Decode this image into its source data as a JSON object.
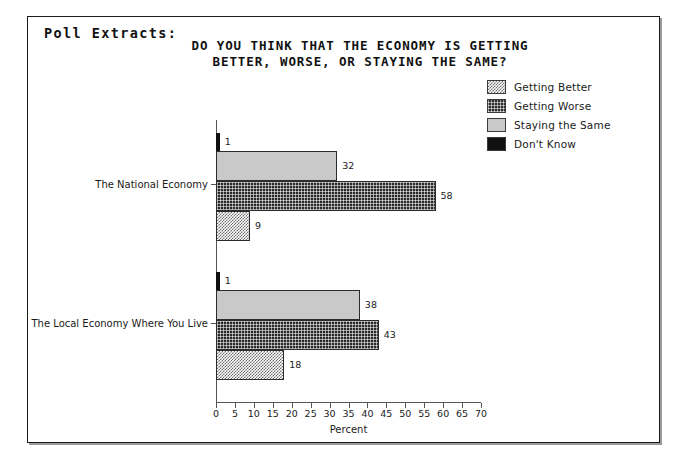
{
  "frame": {
    "poll_extracts_label": "Poll Extracts:"
  },
  "chart_data": {
    "type": "bar",
    "orientation": "horizontal",
    "title_lines": [
      "DO YOU THINK THAT THE ECONOMY IS GETTING",
      "BETTER, WORSE, OR STAYING THE SAME?"
    ],
    "title": "DO YOU THINK THAT THE ECONOMY IS GETTING BETTER, WORSE, OR STAYING THE SAME?",
    "xlabel": "Percent",
    "ylabel": "",
    "xlim": [
      0,
      70
    ],
    "xticks": [
      0,
      5,
      10,
      15,
      20,
      25,
      30,
      35,
      40,
      45,
      50,
      55,
      60,
      65,
      70
    ],
    "grid": false,
    "legend_position": "top-right",
    "categories": [
      "The National Economy",
      "The Local Economy Where You Live"
    ],
    "series": [
      {
        "name": "Getting Better",
        "key": "better",
        "values": [
          9,
          18
        ]
      },
      {
        "name": "Getting Worse",
        "key": "worse",
        "values": [
          58,
          43
        ]
      },
      {
        "name": "Staying the Same",
        "key": "same",
        "values": [
          32,
          38
        ]
      },
      {
        "name": "Don't Know",
        "key": "dontknow",
        "values": [
          1,
          1
        ]
      }
    ],
    "bar_order_top_to_bottom": [
      "Don't Know",
      "Staying the Same",
      "Getting Worse",
      "Getting Better"
    ],
    "groups": [
      {
        "label": "The National Economy",
        "bars": [
          {
            "series": "Don't Know",
            "key": "dontknow",
            "value": 1,
            "value_label": "1"
          },
          {
            "series": "Staying the Same",
            "key": "same",
            "value": 32,
            "value_label": "32"
          },
          {
            "series": "Getting Worse",
            "key": "worse",
            "value": 58,
            "value_label": "58"
          },
          {
            "series": "Getting Better",
            "key": "better",
            "value": 9,
            "value_label": "9"
          }
        ]
      },
      {
        "label": "The Local Economy Where You Live",
        "bars": [
          {
            "series": "Don't Know",
            "key": "dontknow",
            "value": 1,
            "value_label": "1"
          },
          {
            "series": "Staying the Same",
            "key": "same",
            "value": 38,
            "value_label": "38"
          },
          {
            "series": "Getting Worse",
            "key": "worse",
            "value": 43,
            "value_label": "43"
          },
          {
            "series": "Getting Better",
            "key": "better",
            "value": 18,
            "value_label": "18"
          }
        ]
      }
    ],
    "legend": [
      {
        "label": "Getting Better",
        "key": "better"
      },
      {
        "label": "Getting Worse",
        "key": "worse"
      },
      {
        "label": "Staying the Same",
        "key": "same"
      },
      {
        "label": "Don't Know",
        "key": "dontknow"
      }
    ],
    "colors": {
      "getting_better": "#6e6e6e",
      "getting_worse": "#2a2a2a",
      "staying_the_same": "#c9c9c9",
      "dont_know": "#111111",
      "axis": "#555555",
      "text": "#1a1a1a",
      "background": "#ffffff"
    }
  }
}
